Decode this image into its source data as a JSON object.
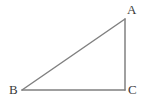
{
  "figure": {
    "name": "right-triangle-ABC",
    "background_color": "#ffffff",
    "stroke_color": "#808080",
    "stroke_width": 1.5,
    "label_color": "#3a3a3a",
    "canvas": {
      "width": 150,
      "height": 110
    }
  },
  "vertices": [
    {
      "id": "A",
      "label": "A",
      "x": 125,
      "y": 19,
      "label_x": 127,
      "label_y": 3
    },
    {
      "id": "B",
      "label": "B",
      "x": 22,
      "y": 90,
      "label_x": 9,
      "label_y": 83
    },
    {
      "id": "C",
      "label": "C",
      "x": 125,
      "y": 90,
      "label_x": 128,
      "label_y": 83
    }
  ],
  "edges": [
    {
      "id": "AB",
      "name": "hypotenuse-AB",
      "from": "A",
      "to": "B",
      "x1": 125,
      "y1": 19,
      "x2": 22,
      "y2": 90
    },
    {
      "id": "BC",
      "name": "base-BC",
      "from": "B",
      "to": "C",
      "x1": 22,
      "y1": 90,
      "x2": 125,
      "y2": 90
    },
    {
      "id": "CA",
      "name": "vertical-leg-CA",
      "from": "C",
      "to": "A",
      "x1": 125,
      "y1": 90,
      "x2": 125,
      "y2": 19
    }
  ],
  "chart_data": {
    "type": "diagram",
    "title": "",
    "shape": "right triangle",
    "right_angle_at": "C",
    "points": {
      "A": [
        125,
        19
      ],
      "B": [
        22,
        90
      ],
      "C": [
        125,
        90
      ]
    },
    "labels": [
      "A",
      "B",
      "C"
    ],
    "segments": [
      "AB",
      "BC",
      "CA"
    ]
  }
}
